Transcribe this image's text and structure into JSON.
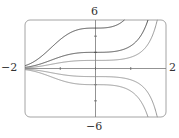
{
  "chart_data": {
    "type": "line",
    "title": "",
    "xlabel": "",
    "ylabel": "",
    "xlim": [
      -2,
      2
    ],
    "ylim": [
      -6,
      6
    ],
    "grid": false,
    "legend": null,
    "function_family": "y = C·e^(x^3/3)",
    "x_tick_labels": [
      "-2",
      "2"
    ],
    "y_tick_labels": [
      "6",
      "-6"
    ],
    "x_ticks": [
      -1,
      0,
      1
    ],
    "y_ticks": [
      -4,
      -2,
      2,
      4
    ],
    "series": [
      {
        "name": "C=5",
        "C": 5,
        "color": "#3a3a3a"
      },
      {
        "name": "C=2",
        "C": 2,
        "color": "#3a3a3a"
      },
      {
        "name": "C=1",
        "C": 1,
        "color": "#8a8a8a"
      },
      {
        "name": "C=-1",
        "C": -1,
        "color": "#8a8a8a"
      },
      {
        "name": "C=-2",
        "C": -2,
        "color": "#8a8a8a"
      }
    ]
  },
  "labels": {
    "y_max": "6",
    "y_min": "−6",
    "x_min": "−2",
    "x_max": "2"
  },
  "frame": {
    "left": 25,
    "top": 20,
    "right": 166,
    "bottom": 117,
    "color": "#9a9a9a"
  }
}
